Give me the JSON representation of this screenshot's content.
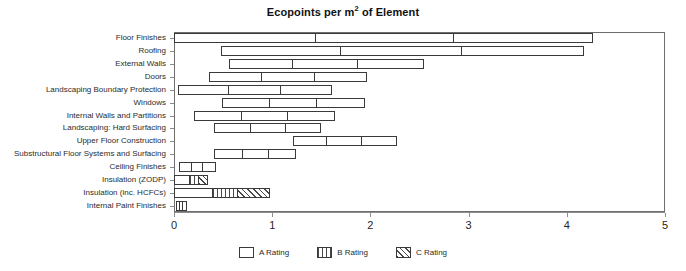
{
  "chart_data": {
    "type": "bar",
    "orientation": "horizontal",
    "subtype": "stacked-range",
    "title": "Ecopoints per m2 of Element",
    "title_parts": {
      "before": "Ecopoints per m",
      "sup": "2",
      "after": " of Element"
    },
    "xlabel": "",
    "ylabel": "",
    "xlim": [
      0,
      5
    ],
    "xticks": [
      0,
      1,
      2,
      3,
      4,
      5
    ],
    "xtick_labels": [
      "0",
      "1",
      "2",
      "3",
      "4",
      "5"
    ],
    "grid": false,
    "legend_position": "bottom-center",
    "legend": [
      {
        "name": "A Rating",
        "pattern": "dots"
      },
      {
        "name": "B Rating",
        "pattern": "vertical-lines"
      },
      {
        "name": "C Rating",
        "pattern": "diagonal-hatch"
      }
    ],
    "categories": [
      "Floor Finishes",
      "Roofing",
      "External Walls",
      "Doors",
      "Landscaping Boundary Protection",
      "Windows",
      "Internal Walls and Partitions",
      "Landscaping: Hard Surfacing",
      "Upper Floor Construction",
      "Substructural Floor Systems and Surfacing",
      "Ceiling Finishes",
      "Insulation (ZODP)",
      "Insulation (inc. HCFCs)",
      "Internal Paint Finishes"
    ],
    "bars": [
      {
        "category": "Floor Finishes",
        "start": 0.0,
        "boundaries": [
          1.45,
          2.85
        ],
        "end": 4.27,
        "patterns": [
          "none",
          "none",
          "none"
        ]
      },
      {
        "category": "Roofing",
        "start": 0.48,
        "boundaries": [
          1.7,
          2.93
        ],
        "end": 4.18,
        "patterns": [
          "none",
          "none",
          "none"
        ]
      },
      {
        "category": "External Walls",
        "start": 0.56,
        "boundaries": [
          1.21,
          1.87
        ],
        "end": 2.55,
        "patterns": [
          "none",
          "none",
          "none"
        ]
      },
      {
        "category": "Doors",
        "start": 0.36,
        "boundaries": [
          0.9,
          1.44
        ],
        "end": 1.97,
        "patterns": [
          "none",
          "none",
          "none"
        ]
      },
      {
        "category": "Landscaping Boundary Protection",
        "start": 0.04,
        "boundaries": [
          0.56,
          1.09
        ],
        "end": 1.61,
        "patterns": [
          "none",
          "none",
          "none"
        ]
      },
      {
        "category": "Windows",
        "start": 0.49,
        "boundaries": [
          0.98,
          1.46
        ],
        "end": 1.95,
        "patterns": [
          "none",
          "none",
          "none"
        ]
      },
      {
        "category": "Internal Walls and Partitions",
        "start": 0.2,
        "boundaries": [
          0.69,
          1.16
        ],
        "end": 1.64,
        "patterns": [
          "none",
          "none",
          "none"
        ]
      },
      {
        "category": "Landscaping: Hard Surfacing",
        "start": 0.41,
        "boundaries": [
          0.78,
          1.14
        ],
        "end": 1.5,
        "patterns": [
          "none",
          "none",
          "none"
        ]
      },
      {
        "category": "Upper Floor Construction",
        "start": 1.21,
        "boundaries": [
          1.56,
          1.91
        ],
        "end": 2.27,
        "patterns": [
          "none",
          "none",
          "none"
        ]
      },
      {
        "category": "Substructural Floor Systems and Surfacing",
        "start": 0.41,
        "boundaries": [
          0.7,
          0.97
        ],
        "end": 1.24,
        "patterns": [
          "none",
          "none",
          "none"
        ]
      },
      {
        "category": "Ceiling Finishes",
        "start": 0.05,
        "boundaries": [
          0.18,
          0.3
        ],
        "end": 0.43,
        "patterns": [
          "none",
          "none",
          "none"
        ]
      },
      {
        "category": "Insulation (ZODP)",
        "start": 0.0,
        "boundaries": [
          0.16,
          0.25
        ],
        "end": 0.35,
        "patterns": [
          "dots",
          "vertical-lines",
          "diagonal-hatch"
        ]
      },
      {
        "category": "Insulation (inc. HCFCs)",
        "start": 0.0,
        "boundaries": [
          0.4,
          0.65
        ],
        "end": 0.98,
        "patterns": [
          "dots",
          "vertical-lines",
          "diagonal-hatch"
        ]
      },
      {
        "category": "Internal Paint Finishes",
        "start": 0.02,
        "boundaries": [
          0.06,
          0.09
        ],
        "end": 0.13,
        "patterns": [
          "none",
          "none",
          "none"
        ]
      }
    ]
  },
  "colors": {
    "frame": "#6e6e6e",
    "axis": "#8d8d8d",
    "bar_outline": "#3a3a3a",
    "text": "#2b2b2b",
    "background": "#ffffff"
  }
}
